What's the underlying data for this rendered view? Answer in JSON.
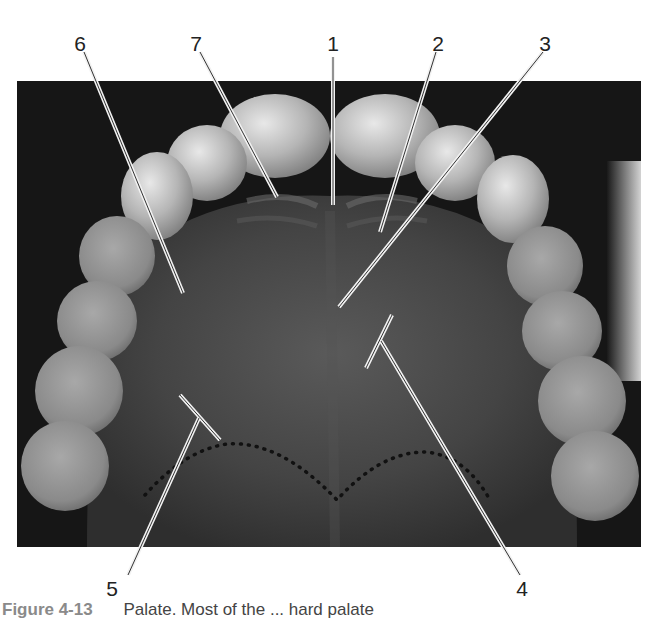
{
  "figure": {
    "labels": [
      {
        "id": "1",
        "text": "1",
        "x": 333,
        "y": 33
      },
      {
        "id": "2",
        "text": "2",
        "x": 438,
        "y": 33
      },
      {
        "id": "3",
        "text": "3",
        "x": 545,
        "y": 33
      },
      {
        "id": "4",
        "text": "4",
        "x": 522,
        "y": 578
      },
      {
        "id": "5",
        "text": "5",
        "x": 112,
        "y": 578
      },
      {
        "id": "6",
        "text": "6",
        "x": 80,
        "y": 33
      },
      {
        "id": "7",
        "text": "7",
        "x": 196,
        "y": 33
      }
    ],
    "caption": {
      "number": "Figure 4-13",
      "text": "Palate. Most of the ... hard palate"
    },
    "colors": {
      "background": "#ffffff",
      "photo_dark": "#1a1a1a",
      "palate": "#4a4a4a",
      "teeth": "#bdbdbd",
      "leader_line": "#f2f2f2",
      "label_text": "#222222"
    }
  }
}
